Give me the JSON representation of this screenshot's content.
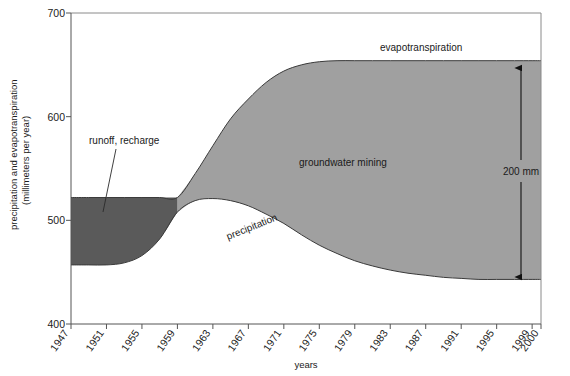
{
  "chart_data": {
    "type": "area",
    "title": "",
    "xlabel": "years",
    "ylabel": "precipitation and evapotranspiration (millimeters per year)",
    "ylabel_line1": "precipitation and evapotranspiration",
    "ylabel_line2": "(millimeters per year)",
    "ylim": [
      400,
      700
    ],
    "xlim": [
      1947,
      2000
    ],
    "grid": false,
    "legend_position": "inline-annotations",
    "y_ticks": [
      400,
      500,
      600,
      700
    ],
    "x_ticks": [
      "1947",
      "1951",
      "1955",
      "1959",
      "1963",
      "1967",
      "1971",
      "1975",
      "1979",
      "1983",
      "1987",
      "1991",
      "1995",
      "1999",
      "2000"
    ],
    "x_tick_values": [
      1947,
      1951,
      1955,
      1959,
      1963,
      1967,
      1971,
      1975,
      1979,
      1983,
      1987,
      1991,
      1995,
      1999,
      2000
    ],
    "x": [
      1947,
      1949,
      1951,
      1953,
      1955,
      1957,
      1959,
      1961,
      1963,
      1965,
      1967,
      1969,
      1971,
      1973,
      1975,
      1977,
      1979,
      1981,
      1983,
      1985,
      1987,
      1989,
      1991,
      1993,
      1995,
      1997,
      1999,
      2000
    ],
    "series": [
      {
        "name": "evapotranspiration",
        "label": "evapotranspiration",
        "color": "#9a9a9a",
        "values": [
          522,
          522,
          522,
          522,
          522,
          522,
          522,
          545,
          572,
          598,
          617,
          633,
          644,
          650,
          653,
          654,
          654,
          654,
          654,
          654,
          654,
          654,
          654,
          654,
          654,
          654,
          654,
          654
        ]
      },
      {
        "name": "precipitation",
        "label": "precipitation",
        "color": "#3a3a3a",
        "values": [
          457,
          457,
          457,
          459,
          466,
          482,
          508,
          519,
          521,
          519,
          514,
          506,
          497,
          486,
          476,
          468,
          461,
          456,
          452,
          449,
          447,
          445,
          444,
          443,
          443,
          443,
          443,
          443
        ]
      }
    ],
    "regions": [
      {
        "name": "runoff-recharge",
        "label": "runoff, recharge",
        "color": "#5a5a5a",
        "description": "area between evapotranspiration (upper) and precipitation (lower) before 1959 crossover"
      },
      {
        "name": "groundwater-mining",
        "label": "groundwater mining",
        "color": "#a0a0a0",
        "description": "area between evapotranspiration (upper) and precipitation (lower) after 1959 crossover"
      }
    ],
    "annotations": [
      {
        "name": "evapotranspiration-label",
        "text": "evapotranspiration"
      },
      {
        "name": "groundwater-mining-label",
        "text": "groundwater mining"
      },
      {
        "name": "precipitation-label",
        "text": "precipitation"
      },
      {
        "name": "runoff-recharge-label",
        "text": "runoff, recharge"
      },
      {
        "name": "dimension-label",
        "text": "200 mm",
        "value": 200,
        "unit": "mm"
      }
    ]
  },
  "axis": {
    "y_tick_700": "700",
    "y_tick_600": "600",
    "y_tick_500": "500",
    "y_tick_400": "400",
    "x_label": "years"
  },
  "labels": {
    "ylabel_line1": "precipitation and evapotranspiration",
    "ylabel_line2": "(millimeters per year)",
    "evapotranspiration": "evapotranspiration",
    "groundwater_mining": "groundwater mining",
    "precipitation": "precipitation",
    "runoff_recharge": "runoff, recharge",
    "dimension": "200 mm"
  },
  "xticks": [
    "1947",
    "1951",
    "1955",
    "1959",
    "1963",
    "1967",
    "1971",
    "1975",
    "1979",
    "1983",
    "1987",
    "1991",
    "1995",
    "1999",
    "2000"
  ],
  "colors": {
    "runoff_recharge_fill": "#5a5a5a",
    "groundwater_mining_fill": "#a0a0a0",
    "curve_stroke": "#3a3a3a",
    "border": "#8a8a8a",
    "text": "#1a1a1a"
  }
}
